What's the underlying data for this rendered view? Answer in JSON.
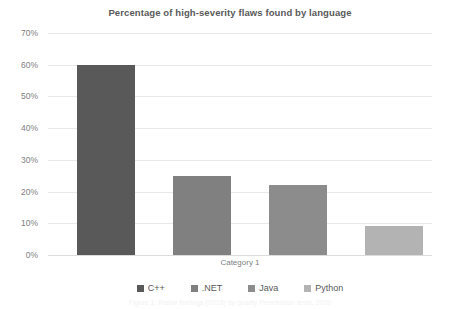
{
  "chart_data": {
    "type": "bar",
    "title": "Percentage of high-severity flaws found by language",
    "xlabel": "Category 1",
    "ylabel": "",
    "categories": [
      "Category 1"
    ],
    "series": [
      {
        "name": "C++",
        "values": [
          60
        ],
        "color": "#595959"
      },
      {
        "name": ".NET",
        "values": [
          25
        ],
        "color": "#808080"
      },
      {
        "name": "Java",
        "values": [
          22
        ],
        "color": "#8c8c8c"
      },
      {
        "name": "Python",
        "values": [
          9
        ],
        "color": "#b3b3b3"
      }
    ],
    "ylim": [
      0,
      70
    ],
    "ytick_step": 10,
    "ytick_labels": [
      "0%",
      "10%",
      "20%",
      "30%",
      "40%",
      "50%",
      "60%",
      "70%"
    ],
    "ytick_values": [
      0,
      10,
      20,
      30,
      40,
      50,
      60,
      70
    ],
    "grid": true,
    "legend_position": "bottom",
    "value_suffix": "%",
    "gridline_color": "#e8e8e8",
    "axis_color": "#dcdcdc",
    "text_color": "#595959",
    "tick_color": "#808080",
    "background": "#ffffff"
  },
  "caption": {
    "text": "Figure 1: Radar findings (2018) by quality Penetration tests, 2020"
  }
}
